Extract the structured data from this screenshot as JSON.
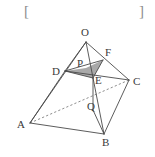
{
  "figure": {
    "kind": "geometry-diagram",
    "canvas": {
      "width": 155,
      "height": 157
    },
    "colors": {
      "stroke": "#4a4a4a",
      "dashed_stroke": "#6f6f6f",
      "shade_fill": "#a9a9a9",
      "label_color": "#3a3a3a",
      "bracket_color": "#8c8c8c",
      "background": "#ffffff"
    },
    "brackets": {
      "left": "[",
      "right": "]"
    },
    "points": [
      {
        "name": "O",
        "label": "O",
        "x": 86,
        "y": 42,
        "label_x": 81,
        "label_y": 27
      },
      {
        "name": "A",
        "label": "A",
        "x": 30,
        "y": 123,
        "label_x": 17,
        "label_y": 119
      },
      {
        "name": "B",
        "label": "B",
        "x": 104,
        "y": 134,
        "label_x": 102,
        "label_y": 137
      },
      {
        "name": "C",
        "label": "C",
        "x": 129,
        "y": 80,
        "label_x": 133,
        "label_y": 76
      },
      {
        "name": "D",
        "label": "D",
        "x": 65,
        "y": 71,
        "label_x": 52,
        "label_y": 66
      },
      {
        "name": "E",
        "label": "E",
        "x": 93,
        "y": 78,
        "label_x": 95,
        "label_y": 75
      },
      {
        "name": "F",
        "label": "F",
        "x": 103,
        "y": 60,
        "label_x": 105,
        "label_y": 47
      },
      {
        "name": "P",
        "label": "P",
        "x": 86,
        "y": 68,
        "label_x": 77,
        "label_y": 58
      },
      {
        "name": "Q",
        "label": "Q",
        "x": 93,
        "y": 110,
        "label_x": 87,
        "label_y": 101
      }
    ],
    "solid_edges": [
      {
        "name": "edge-O-A",
        "from": "O",
        "to": "A"
      },
      {
        "name": "edge-O-B",
        "from": "O",
        "to": "B"
      },
      {
        "name": "edge-O-C",
        "from": "O",
        "to": "C"
      },
      {
        "name": "edge-O-D",
        "from": "O",
        "to": "D"
      },
      {
        "name": "edge-A-B",
        "from": "A",
        "to": "B"
      },
      {
        "name": "edge-B-C",
        "from": "B",
        "to": "C"
      },
      {
        "name": "edge-A-D",
        "from": "A",
        "to": "D"
      },
      {
        "name": "edge-D-C",
        "from": "D",
        "to": "C"
      },
      {
        "name": "edge-D-F",
        "from": "D",
        "to": "F"
      },
      {
        "name": "edge-D-E",
        "from": "D",
        "to": "E"
      },
      {
        "name": "edge-E-F",
        "from": "E",
        "to": "F"
      },
      {
        "name": "edge-E-Q",
        "from": "E",
        "to": "Q"
      },
      {
        "name": "edge-Q-B",
        "from": "Q",
        "to": "B"
      }
    ],
    "dashed_edges": [
      {
        "name": "diagonal-A-C",
        "from": "A",
        "to": "C"
      }
    ],
    "shaded_region": {
      "name": "quadrilateral-DPFE",
      "vertices": [
        "D",
        "P",
        "F",
        "E"
      ],
      "fill": "#a9a9a9"
    }
  }
}
